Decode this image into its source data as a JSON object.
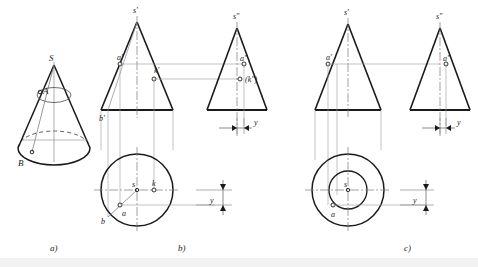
{
  "figure": {
    "captions": [
      {
        "id": "a",
        "label": "a)"
      },
      {
        "id": "b",
        "label": "b)"
      },
      {
        "id": "c",
        "label": "c)"
      }
    ],
    "colors": {
      "outline": "#1a1a1a",
      "thin": "#8a8a8a",
      "center": "#7a7a7a",
      "background": "#ffffff",
      "footer": "#f2f2f2"
    },
    "panel_a": {
      "caption": "a)",
      "description": "pictorial view of a cone with apex S, surface point A and base point B",
      "labels": [
        {
          "name": "apex",
          "text": "S"
        },
        {
          "name": "surface-point",
          "text": "A"
        },
        {
          "name": "base-point",
          "text": "B"
        }
      ]
    },
    "panel_b": {
      "caption": "b)",
      "description": "three-view projection: front view, side view and top view of a cone with points A, B, K",
      "front_view_labels": [
        {
          "name": "apex-front",
          "text": "s'"
        },
        {
          "name": "point-a-front",
          "text": "a'"
        },
        {
          "name": "point-k-front",
          "text": "k'"
        },
        {
          "name": "point-b-front",
          "text": "b'"
        }
      ],
      "side_view_labels": [
        {
          "name": "apex-side",
          "text": "s\""
        },
        {
          "name": "point-a-side",
          "text": "a\""
        },
        {
          "name": "point-k-side",
          "text": "(k\")"
        }
      ],
      "top_view_labels": [
        {
          "name": "apex-top",
          "text": "s"
        },
        {
          "name": "point-k-top",
          "text": "k"
        },
        {
          "name": "point-a-top",
          "text": "a"
        },
        {
          "name": "point-b-top",
          "text": "b"
        }
      ],
      "dimensions": [
        {
          "name": "y-dimension-side",
          "text": "y"
        },
        {
          "name": "y-dimension-top",
          "text": "y"
        }
      ]
    },
    "panel_c": {
      "caption": "c)",
      "description": "three-view projection: front view, side view and top view of a cone with point A, top view shown as two concentric circles",
      "front_view_labels": [
        {
          "name": "apex-front",
          "text": "s'"
        },
        {
          "name": "point-a-front",
          "text": "a'"
        }
      ],
      "side_view_labels": [
        {
          "name": "apex-side",
          "text": "s\""
        },
        {
          "name": "point-a-side",
          "text": "a\""
        }
      ],
      "top_view_labels": [
        {
          "name": "apex-top",
          "text": "s"
        },
        {
          "name": "point-a-top",
          "text": "a"
        }
      ],
      "dimensions": [
        {
          "name": "y-dimension-side",
          "text": "y"
        },
        {
          "name": "y-dimension-top",
          "text": "y"
        }
      ]
    }
  }
}
